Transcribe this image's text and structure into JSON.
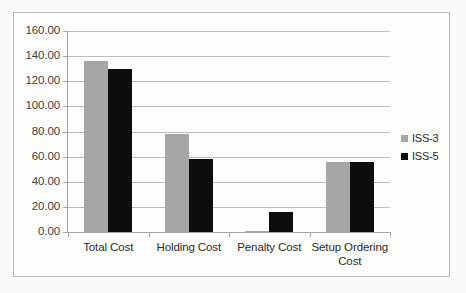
{
  "chart_data": {
    "type": "bar",
    "title": "",
    "xlabel": "",
    "ylabel": "",
    "categories": [
      "Total Cost",
      "Holding Cost",
      "Penalty Cost",
      "Setup Ordering Cost"
    ],
    "series": [
      {
        "name": "ISS-3",
        "color": "#a6a6a6",
        "values": [
          136.0,
          78.0,
          1.0,
          55.5
        ]
      },
      {
        "name": "ISS-5",
        "color": "#0d0d0d",
        "values": [
          130.0,
          58.5,
          16.0,
          55.5
        ]
      }
    ],
    "ylim": [
      0,
      160
    ],
    "ytick_values": [
      0,
      20,
      40,
      60,
      80,
      100,
      120,
      140,
      160
    ],
    "ytick_labels": [
      "0.00",
      "20.00",
      "40.00",
      "60.00",
      "80.00",
      "100.00",
      "120.00",
      "140.00",
      "160.00"
    ],
    "grid": "horizontal",
    "legend_position": "right",
    "legend": [
      {
        "label": "ISS-3",
        "swatch_color": "#a6a6a6"
      },
      {
        "label": "ISS-5",
        "swatch_color": "#0d0d0d"
      }
    ]
  }
}
